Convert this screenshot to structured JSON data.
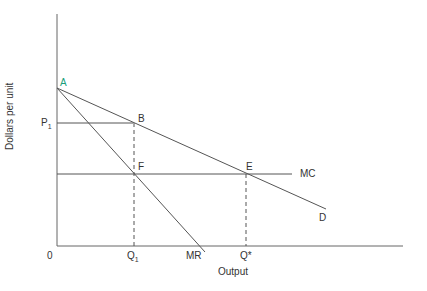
{
  "diagram": {
    "ylabel": "Dollars per unit",
    "xlabel": "Output",
    "origin": "0",
    "points": {
      "A": "A",
      "B": "B",
      "F": "F",
      "E": "E"
    },
    "curves": {
      "MC": "MC",
      "D": "D",
      "MR": "MR"
    },
    "yticks": {
      "P1_main": "P",
      "P1_sub": "1"
    },
    "xticks": {
      "Q1_main": "Q",
      "Q1_sub": "1",
      "Qstar": "Q*"
    },
    "colors": {
      "line": "#555555",
      "point_A": "#1a9e7a"
    }
  }
}
